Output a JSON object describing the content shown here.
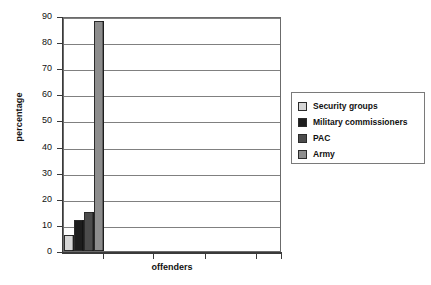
{
  "chart_data": {
    "type": "bar",
    "title": "",
    "xlabel": "offenders",
    "ylabel": "percentage",
    "categories": [
      "offenders"
    ],
    "ylim": [
      0,
      90
    ],
    "yticks": [
      0,
      10,
      20,
      30,
      40,
      50,
      60,
      70,
      80,
      90
    ],
    "ytick_labels": [
      "0",
      "10",
      "20",
      "30",
      "40",
      "50",
      "60",
      "70",
      "80",
      "90"
    ],
    "grid": true,
    "legend_position": "right",
    "series": [
      {
        "name": "Security groups",
        "values": [
          6
        ],
        "color": "#d6d6d6"
      },
      {
        "name": "Military commissioners",
        "values": [
          12
        ],
        "color": "#1d1d1d"
      },
      {
        "name": "PAC",
        "values": [
          15
        ],
        "color": "#4c4c4c"
      },
      {
        "name": "Army",
        "values": [
          88
        ],
        "color": "#8d8d8d"
      }
    ]
  },
  "legend": {
    "items": [
      {
        "label": "Security groups",
        "color": "#d6d6d6"
      },
      {
        "label": "Military commissioners",
        "color": "#1d1d1d"
      },
      {
        "label": "PAC",
        "color": "#4c4c4c"
      },
      {
        "label": "Army",
        "color": "#8d8d8d"
      }
    ]
  }
}
